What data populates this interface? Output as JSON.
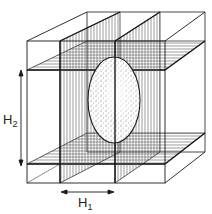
{
  "diagram": {
    "labels": {
      "h1": {
        "main": "H",
        "sub": "1"
      },
      "h2": {
        "main": "H",
        "sub": "2"
      }
    },
    "colors": {
      "stroke": "#1a1a1a",
      "hatch": "#555555",
      "background": "#ffffff",
      "stipple": "#444444"
    }
  }
}
